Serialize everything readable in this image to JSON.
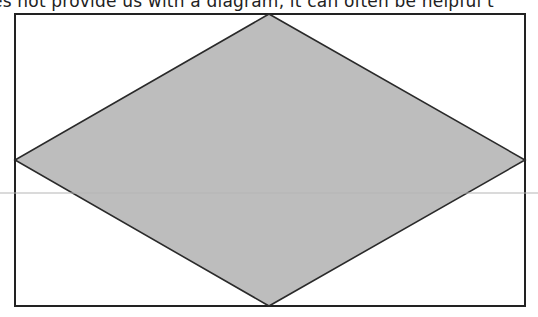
{
  "header": {
    "partial_text": "es not provide us with a diagram, it can often be helpful t"
  },
  "diagram": {
    "type": "rhombus-inscribed-in-rectangle",
    "rectangle": {
      "x": 15,
      "y": 14,
      "width": 510,
      "height": 292,
      "stroke": "#222222",
      "fill": "#ffffff"
    },
    "rhombus": {
      "vertices": {
        "top": [
          269,
          14
        ],
        "right": [
          525,
          160
        ],
        "bottom": [
          269,
          306
        ],
        "left": [
          15,
          160
        ]
      },
      "fill": "#bdbdbd",
      "stroke": "#2a2a2a"
    },
    "guide_line": {
      "y": 193,
      "color": "#b5b5b5"
    }
  }
}
